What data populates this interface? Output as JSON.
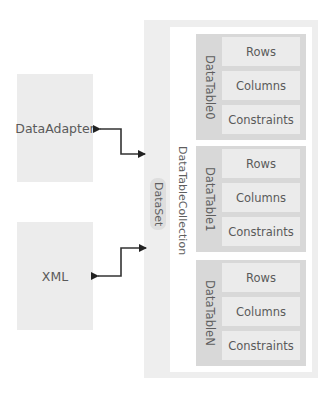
{
  "diagram": {
    "sources": [
      {
        "label": "DataAdapter"
      },
      {
        "label": "XML"
      }
    ],
    "dataset": {
      "label": "DataSet",
      "collection_label": "DataTableCollection",
      "tables": [
        {
          "label": "DataTable0",
          "members": [
            "Rows",
            "Columns",
            "Constraints"
          ]
        },
        {
          "label": "DataTable1",
          "members": [
            "Rows",
            "Columns",
            "Constraints"
          ]
        },
        {
          "label": "DataTableN",
          "members": [
            "Rows",
            "Columns",
            "Constraints"
          ]
        }
      ]
    },
    "connections": [
      {
        "from": "DataAdapter",
        "to": "DataSet",
        "type": "bidirectional-arrow"
      },
      {
        "from": "XML",
        "to": "DataSet",
        "type": "bidirectional-arrow"
      }
    ],
    "colors": {
      "source_fill": "#ececec",
      "dataset_fill": "#eeeeee",
      "table_fill": "#d8d8d8",
      "member_fill": "#ebebeb",
      "arrow": "#222222"
    }
  }
}
